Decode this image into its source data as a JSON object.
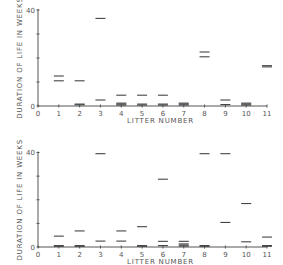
{
  "chart_data": [
    {
      "type": "scatter",
      "panel": "top",
      "title": "",
      "xlabel": "LITTER NUMBER",
      "ylabel": "DURATION OF LIFE IN WEEKS",
      "xlim": [
        0,
        11
      ],
      "ylim": [
        0,
        40
      ],
      "x_ticks": [
        0,
        1,
        2,
        3,
        4,
        5,
        6,
        7,
        8,
        9,
        10,
        11
      ],
      "x_tick_labels": [
        "0",
        "1",
        "2",
        "3",
        "4",
        "5",
        "6",
        "7",
        "8",
        "9",
        "10",
        "11"
      ],
      "y_ticks": [
        0,
        10,
        20,
        30,
        40
      ],
      "y_tick_labels": [
        "0",
        "",
        "",
        "",
        "40"
      ],
      "marker": "horizontal-dash",
      "points": [
        {
          "litter": 1,
          "values": [
            12.5,
            10.5
          ]
        },
        {
          "litter": 2,
          "values": [
            10.5,
            0.8,
            0.5
          ]
        },
        {
          "litter": 3,
          "values": [
            36.5,
            2.5
          ]
        },
        {
          "litter": 4,
          "values": [
            4.5,
            1.2,
            0.8,
            0.4
          ]
        },
        {
          "litter": 5,
          "values": [
            4.5,
            0.8,
            0.4
          ]
        },
        {
          "litter": 6,
          "values": [
            4.5,
            0.8,
            0.4
          ]
        },
        {
          "litter": 7,
          "values": [
            1.2,
            0.8,
            0.4
          ]
        },
        {
          "litter": 8,
          "values": [
            22.5,
            20.5
          ]
        },
        {
          "litter": 9,
          "values": [
            2.5,
            0.6
          ]
        },
        {
          "litter": 10,
          "values": [
            1.2,
            0.8,
            0.4
          ]
        },
        {
          "litter": 11,
          "values": [
            16.8,
            16.3
          ]
        }
      ]
    },
    {
      "type": "scatter",
      "panel": "bottom",
      "title": "",
      "xlabel": "LITTER NUMBER",
      "ylabel": "DURATION OF LIFE IN WEEKS",
      "xlim": [
        0,
        11
      ],
      "ylim": [
        0,
        40
      ],
      "x_ticks": [
        0,
        1,
        2,
        3,
        4,
        5,
        6,
        7,
        8,
        9,
        10,
        11
      ],
      "x_tick_labels": [
        "0",
        "1",
        "2",
        "3",
        "4",
        "5",
        "6",
        "7",
        "8",
        "9",
        "10",
        "11"
      ],
      "y_ticks": [
        0,
        10,
        20,
        30,
        40
      ],
      "y_tick_labels": [
        "0",
        "",
        "",
        "",
        "40"
      ],
      "marker": "horizontal-dash",
      "points": [
        {
          "litter": 1,
          "values": [
            4.6,
            0.6,
            0.3
          ]
        },
        {
          "litter": 2,
          "values": [
            6.8,
            0.6,
            0.3
          ]
        },
        {
          "litter": 3,
          "values": [
            39.5,
            2.5
          ]
        },
        {
          "litter": 4,
          "values": [
            6.8,
            2.5
          ]
        },
        {
          "litter": 5,
          "values": [
            8.6,
            0.6,
            0.3
          ]
        },
        {
          "litter": 6,
          "values": [
            28.7,
            2.4,
            0.6
          ]
        },
        {
          "litter": 7,
          "values": [
            2.4,
            1.3,
            0.8,
            0.4
          ]
        },
        {
          "litter": 8,
          "values": [
            39.5,
            0.6,
            0.3
          ]
        },
        {
          "litter": 9,
          "values": [
            39.5,
            10.4
          ]
        },
        {
          "litter": 10,
          "values": [
            18.4,
            2.2
          ]
        },
        {
          "litter": 11,
          "values": [
            4.2,
            0.6,
            0.3
          ]
        }
      ]
    }
  ]
}
